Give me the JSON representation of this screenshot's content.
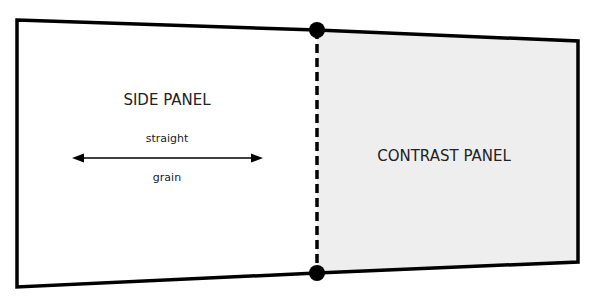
{
  "diagram": {
    "side_panel": {
      "label": "SIDE PANEL",
      "fill": "#ffffff"
    },
    "contrast_panel": {
      "label": "CONTRAST PANEL",
      "fill": "#eeeeee"
    },
    "grain_arrow": {
      "label_top": "straight",
      "label_bottom": "grain",
      "icon": "double-headed-arrow"
    },
    "seam": {
      "style": "dashed",
      "markers": [
        "top-dot",
        "bottom-dot"
      ]
    },
    "colors": {
      "outline": "#000000",
      "text": "#222222",
      "contrast_fill": "#eeeeee"
    }
  }
}
